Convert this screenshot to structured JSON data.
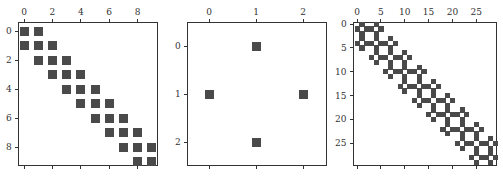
{
  "chart_data": [
    {
      "type": "heatmap",
      "title": "",
      "description": "Sparsity pattern (spy plot) of a 10x10 tridiagonal matrix",
      "shape": [
        10,
        10
      ],
      "xlabel": "",
      "ylabel": "",
      "xticks": [
        0,
        2,
        4,
        6,
        8
      ],
      "yticks": [
        0,
        2,
        4,
        6,
        8
      ],
      "xlim": [
        -0.5,
        9.5
      ],
      "ylim": [
        9.5,
        -0.5
      ],
      "nonzero_pattern": "tridiagonal",
      "nonzeros": [
        [
          0,
          0
        ],
        [
          0,
          1
        ],
        [
          1,
          0
        ],
        [
          1,
          1
        ],
        [
          1,
          2
        ],
        [
          2,
          1
        ],
        [
          2,
          2
        ],
        [
          2,
          3
        ],
        [
          3,
          2
        ],
        [
          3,
          3
        ],
        [
          3,
          4
        ],
        [
          4,
          3
        ],
        [
          4,
          4
        ],
        [
          4,
          5
        ],
        [
          5,
          4
        ],
        [
          5,
          5
        ],
        [
          5,
          6
        ],
        [
          6,
          5
        ],
        [
          6,
          6
        ],
        [
          6,
          7
        ],
        [
          7,
          6
        ],
        [
          7,
          7
        ],
        [
          7,
          8
        ],
        [
          8,
          7
        ],
        [
          8,
          8
        ],
        [
          8,
          9
        ],
        [
          9,
          8
        ],
        [
          9,
          9
        ]
      ],
      "box": {
        "left": 18,
        "top": 22,
        "width": 140,
        "height": 144
      },
      "x0": 24,
      "dx": 14.2,
      "y0": 31,
      "dy": 14.5,
      "cell": 9,
      "tick_labels_x": [
        "0",
        "2",
        "4",
        "6",
        "8"
      ],
      "tick_labels_y": [
        "0",
        "2",
        "4",
        "6",
        "8"
      ]
    },
    {
      "type": "heatmap",
      "title": "",
      "description": "Sparsity pattern of a 3x3 cross (5-point stencil without center)",
      "shape": [
        3,
        3
      ],
      "xlabel": "",
      "ylabel": "",
      "xticks": [
        0,
        1,
        2
      ],
      "yticks": [
        0,
        1,
        2
      ],
      "xlim": [
        -0.5,
        2.5
      ],
      "ylim": [
        2.5,
        -0.5
      ],
      "nonzeros": [
        [
          0,
          1
        ],
        [
          1,
          0
        ],
        [
          1,
          2
        ],
        [
          2,
          1
        ]
      ],
      "box": {
        "left": 187,
        "top": 22,
        "width": 140,
        "height": 144
      },
      "x0": 209,
      "dx": 47,
      "y0": 46,
      "dy": 48,
      "cell": 9,
      "tick_labels_x": [
        "0",
        "1",
        "2"
      ],
      "tick_labels_y": [
        "0",
        "1",
        "2"
      ]
    },
    {
      "type": "heatmap",
      "title": "",
      "description": "Sparsity pattern of the 30x30 Kronecker product of the tridiagonal (10x10) and cross (3x3) patterns",
      "shape": [
        30,
        30
      ],
      "xlabel": "",
      "ylabel": "",
      "xticks": [
        0,
        5,
        10,
        15,
        20,
        25
      ],
      "yticks": [
        0,
        5,
        10,
        15,
        20,
        25
      ],
      "xlim": [
        -0.5,
        29.5
      ],
      "ylim": [
        29.5,
        -0.5
      ],
      "nonzero_pattern": "kron(tridiagonal_10, cross_3)",
      "box": {
        "left": 353,
        "top": 22,
        "width": 144,
        "height": 144
      },
      "x0": 357,
      "dx": 4.77,
      "y0": 24,
      "dy": 4.77,
      "cell": 4.77,
      "tick_labels_x": [
        "0",
        "5",
        "10",
        "15",
        "20",
        "25"
      ],
      "tick_labels_y": [
        "0",
        "5",
        "10",
        "15",
        "20",
        "25"
      ]
    }
  ]
}
